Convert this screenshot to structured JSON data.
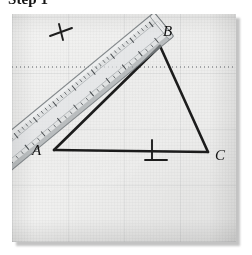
{
  "heading": {
    "text": "Step 1"
  },
  "figure": {
    "name": "photograph-of-construction",
    "caption_alt": "Transparent ruler laid across triangle ABC drawn on paper",
    "paper": {
      "fold_line": "dotted horizontal perforation"
    },
    "triangle": {
      "label": "triangle-ABC",
      "vertices": [
        {
          "id": "A",
          "label": "A",
          "x": 42,
          "y": 138
        },
        {
          "id": "B",
          "label": "B",
          "x": 148,
          "y": 32
        },
        {
          "id": "C",
          "label": "C",
          "x": 196,
          "y": 140
        }
      ],
      "sides": [
        {
          "id": "AB",
          "from": "A",
          "to": "B"
        },
        {
          "id": "BC",
          "from": "B",
          "to": "C"
        },
        {
          "id": "AC",
          "from": "A",
          "to": "C"
        }
      ],
      "tick_marks": [
        {
          "id": "tick-on-AC",
          "on_side": "AC",
          "x": 140,
          "y": 136,
          "count": 1
        },
        {
          "id": "tick-on-AB",
          "on_side": "AB",
          "x": 48,
          "y": 18,
          "count": 1
        }
      ]
    },
    "ruler": {
      "name": "transparent-straightedge",
      "orientation": "diagonal, upper-left to lower-right",
      "material": "clear plastic",
      "graduated": true
    }
  },
  "colors": {
    "ink": "#1d1d1d",
    "paper": "#f1f1f0",
    "shadow": "#b9b9b9",
    "ruler_body": "rgba(214,218,219,0.50)",
    "ruler_edge": "rgba(108,114,118,0.80)"
  }
}
